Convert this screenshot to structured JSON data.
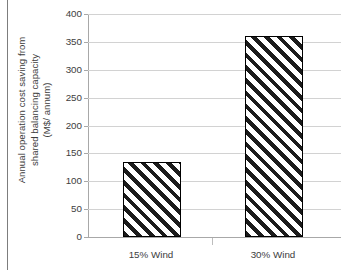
{
  "chart_data": {
    "type": "bar",
    "title": "",
    "xlabel": "",
    "ylabel": "Annual operation cost saving from shared balancing capacity (M$/ annum)",
    "ylabel_lines": [
      "Annual operation cost saving from",
      "shared balancing capacity",
      "(M$/ annum)"
    ],
    "categories": [
      "15% Wind",
      "30% Wind"
    ],
    "values": [
      134,
      360
    ],
    "ylim": [
      0,
      400
    ],
    "ytick_step": 50,
    "yticks": [
      0,
      50,
      100,
      150,
      200,
      250,
      300,
      350,
      400
    ],
    "ytick_labels": [
      "0",
      "50",
      "100",
      "150",
      "200",
      "250",
      "300",
      "350",
      "400"
    ],
    "grid": "horizontal",
    "legend": "none",
    "series": [
      {
        "name": "Annual operation cost saving",
        "values": [
          134,
          360
        ],
        "fill": "diagonal-hatch",
        "fill_color": "#1b1b1b",
        "background_color": "#ffffff",
        "edge_color": "#000000"
      }
    ],
    "colors": {
      "hatch": "#1b1b1b",
      "bar_background": "#ffffff",
      "bar_edge": "#000000",
      "gridline": "#d2d2d2",
      "axis": "#a8a8a8",
      "text": "#3d3d3d",
      "frame_rule": "#7d7d7d",
      "page_background": "#ffffff"
    }
  }
}
